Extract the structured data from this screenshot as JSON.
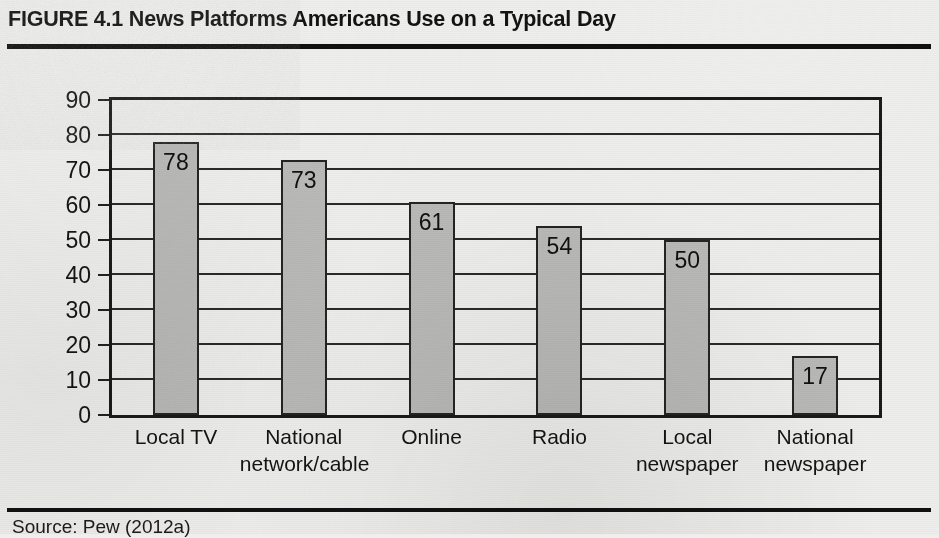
{
  "figure": {
    "label": "FIGURE 4.1",
    "title": "News Platforms Americans Use on a Typical Day",
    "full_title": "FIGURE 4.1  News Platforms Americans Use on a Typical Day",
    "source": "Source: Pew (2012a)"
  },
  "colors": {
    "bar_fill": "#b9b9b7",
    "bar_border": "#242424",
    "plot_background": "#ededeb",
    "page_background": "#eeeeec",
    "rule": "#111111",
    "text": "#141414"
  },
  "chart_data": {
    "type": "bar",
    "title": "News Platforms Americans Use on a Typical Day",
    "xlabel": "",
    "ylabel": "% of Adults (18+)",
    "categories": [
      "Local TV",
      "National network/cable",
      "Online",
      "Radio",
      "Local newspaper",
      "National newspaper"
    ],
    "category_lines": [
      [
        "Local TV"
      ],
      [
        "National",
        "network/cable"
      ],
      [
        "Online"
      ],
      [
        "Radio"
      ],
      [
        "Local",
        "newspaper"
      ],
      [
        "National",
        "newspaper"
      ]
    ],
    "values": [
      78,
      73,
      61,
      54,
      50,
      17
    ],
    "ylim": [
      0,
      90
    ],
    "yticks": [
      0,
      10,
      20,
      30,
      40,
      50,
      60,
      70,
      80,
      90
    ],
    "ytick_labels": [
      "0",
      "10",
      "20",
      "30",
      "40",
      "50",
      "60",
      "70",
      "80",
      "90"
    ],
    "grid": true,
    "grid_axis": "y",
    "legend": false,
    "value_labels": [
      "78",
      "73",
      "61",
      "54",
      "50",
      "17"
    ]
  }
}
